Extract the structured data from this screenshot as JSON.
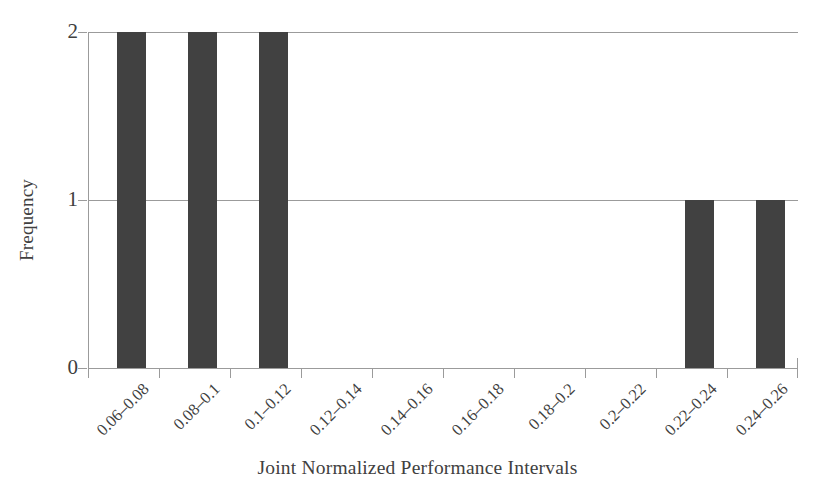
{
  "chart_data": {
    "type": "bar",
    "title": "",
    "subtitle": "",
    "xlabel": "Joint Normalized Performance Intervals",
    "ylabel": "Frequency",
    "categories": [
      "0.06–0.08",
      "0.08–0.1",
      "0.1–0.12",
      "0.12–0.14",
      "0.14–0.16",
      "0.16–0.18",
      "0.18–0.2",
      "0.2–0.22",
      "0.22–0.24",
      "0.24–0.26"
    ],
    "values": [
      2,
      2,
      2,
      0,
      0,
      0,
      0,
      0,
      1,
      1
    ],
    "ylim": [
      0,
      2
    ],
    "yticks": [
      "0",
      "1",
      "2"
    ],
    "ytick_values": [
      0,
      1,
      2
    ],
    "grid": true,
    "grid_axis": "y",
    "legend": "none",
    "bar_color": "#414141",
    "axis_color": "#9b9b9b",
    "text_color": "#404040",
    "background": "#ffffff",
    "xtick_rotation": -45
  }
}
